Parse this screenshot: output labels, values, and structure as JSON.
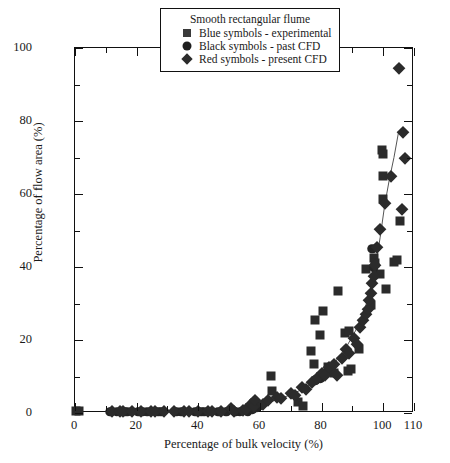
{
  "chart_data": {
    "type": "scatter",
    "title": "",
    "xlabel": "Percentage of bulk velocity (%)",
    "ylabel": "Percentage of flow area (%)",
    "xlim": [
      0,
      110
    ],
    "ylim": [
      0,
      100
    ],
    "xticks": [
      0,
      20,
      40,
      60,
      80,
      100,
      110
    ],
    "xticks_major": [
      0,
      20,
      40,
      60,
      80,
      100,
      110
    ],
    "xticks_minor": [
      10,
      30,
      50,
      70,
      90
    ],
    "yticks": [
      0,
      20,
      40,
      60,
      80,
      100
    ],
    "yticks_minor": [
      10,
      30,
      50,
      70,
      90
    ],
    "grid": false,
    "legend_position": "top-center",
    "legend": {
      "title": "Smooth rectangular flume",
      "entries": [
        {
          "symbol": "square",
          "label": "Blue symbols - experimental",
          "color": "#3a3a3a"
        },
        {
          "symbol": "circle",
          "label": "Black symbols - past CFD",
          "color": "#1e1e1e"
        },
        {
          "symbol": "diamond",
          "label": "Red symbols - present CFD",
          "color": "#2b2b2b"
        }
      ]
    },
    "series": [
      {
        "name": "Blue symbols - experimental",
        "symbol": "square",
        "color": "#2b2b2b",
        "points": [
          [
            0.4,
            0.5
          ],
          [
            1.2,
            0.5
          ],
          [
            63.5,
            10.2
          ],
          [
            64.0,
            6.0
          ],
          [
            72.5,
            3.0
          ],
          [
            74.0,
            2.0
          ],
          [
            76.5,
            17.0
          ],
          [
            77.5,
            13.5
          ],
          [
            78.0,
            25.5
          ],
          [
            79.5,
            21.5
          ],
          [
            80.5,
            28.0
          ],
          [
            82.0,
            12.5
          ],
          [
            83.0,
            11.5
          ],
          [
            84.0,
            11.0
          ],
          [
            85.5,
            33.5
          ],
          [
            87.5,
            22.0
          ],
          [
            89.0,
            22.5
          ],
          [
            88.5,
            11.5
          ],
          [
            89.5,
            12.0
          ],
          [
            92.0,
            17.5
          ],
          [
            94.5,
            39.5
          ],
          [
            96.0,
            29.5
          ],
          [
            97.0,
            42.5
          ],
          [
            97.5,
            41.0
          ],
          [
            99.0,
            38.0
          ],
          [
            99.5,
            72.0
          ],
          [
            99.8,
            71.0
          ],
          [
            99.9,
            65.0
          ],
          [
            100.0,
            58.5
          ],
          [
            101.0,
            34.0
          ],
          [
            103.5,
            41.5
          ],
          [
            104.5,
            42.0
          ],
          [
            105.5,
            52.5
          ]
        ]
      },
      {
        "name": "Black symbols - past CFD",
        "symbol": "circle",
        "color": "#242424",
        "points": [
          [
            11.5,
            0.4
          ],
          [
            13.5,
            0.4
          ],
          [
            16.0,
            0.4
          ],
          [
            17.0,
            0.4
          ],
          [
            20.5,
            0.4
          ],
          [
            22.0,
            0.4
          ],
          [
            23.5,
            0.4
          ],
          [
            27.0,
            0.4
          ],
          [
            28.0,
            0.4
          ],
          [
            33.0,
            0.4
          ],
          [
            34.5,
            0.4
          ],
          [
            39.0,
            0.4
          ],
          [
            41.0,
            0.4
          ],
          [
            42.0,
            0.4
          ],
          [
            46.5,
            0.4
          ],
          [
            49.0,
            0.4
          ],
          [
            52.0,
            0.4
          ],
          [
            53.5,
            0.4
          ],
          [
            56.0,
            0.5
          ],
          [
            57.5,
            1.0
          ],
          [
            59.0,
            1.5
          ],
          [
            60.0,
            2.0
          ],
          [
            78.0,
            9.0
          ],
          [
            79.5,
            9.5
          ],
          [
            96.5,
            45.0
          ],
          [
            97.0,
            40.0
          ]
        ]
      },
      {
        "name": "Red symbols - present CFD",
        "symbol": "diamond",
        "color": "#2b2b2b",
        "points": [
          [
            12.0,
            0.5
          ],
          [
            14.5,
            0.5
          ],
          [
            15.5,
            0.5
          ],
          [
            18.5,
            0.5
          ],
          [
            21.5,
            0.5
          ],
          [
            24.5,
            0.5
          ],
          [
            26.0,
            0.5
          ],
          [
            29.0,
            0.5
          ],
          [
            32.0,
            0.5
          ],
          [
            35.5,
            0.5
          ],
          [
            37.0,
            0.5
          ],
          [
            40.0,
            0.5
          ],
          [
            43.0,
            0.5
          ],
          [
            44.5,
            0.5
          ],
          [
            47.5,
            0.5
          ],
          [
            50.5,
            1.5
          ],
          [
            51.5,
            0.5
          ],
          [
            54.5,
            0.8
          ],
          [
            55.5,
            1.2
          ],
          [
            57.0,
            2.5
          ],
          [
            58.0,
            1.8
          ],
          [
            58.5,
            3.5
          ],
          [
            61.0,
            2.5
          ],
          [
            62.5,
            3.5
          ],
          [
            65.5,
            4.5
          ],
          [
            67.0,
            4.0
          ],
          [
            70.0,
            5.5
          ],
          [
            71.5,
            5.0
          ],
          [
            73.5,
            7.0
          ],
          [
            75.0,
            6.5
          ],
          [
            77.0,
            8.5
          ],
          [
            78.5,
            9.5
          ],
          [
            80.0,
            11.0
          ],
          [
            81.0,
            10.5
          ],
          [
            82.5,
            12.5
          ],
          [
            84.0,
            13.5
          ],
          [
            85.0,
            10.5
          ],
          [
            86.5,
            15.0
          ],
          [
            88.0,
            17.5
          ],
          [
            89.0,
            16.5
          ],
          [
            90.5,
            20.5
          ],
          [
            91.5,
            19.0
          ],
          [
            92.5,
            23.5
          ],
          [
            93.5,
            25.5
          ],
          [
            94.5,
            27.0
          ],
          [
            95.0,
            28.5
          ],
          [
            95.5,
            31.0
          ],
          [
            96.0,
            33.0
          ],
          [
            96.5,
            35.5
          ],
          [
            97.0,
            37.5
          ],
          [
            97.5,
            40.5
          ],
          [
            98.0,
            45.5
          ],
          [
            99.0,
            50.5
          ],
          [
            100.5,
            57.5
          ],
          [
            102.5,
            65.0
          ],
          [
            105.0,
            94.5
          ],
          [
            106.5,
            77.0
          ],
          [
            107.0,
            70.0
          ],
          [
            106.0,
            56.0
          ]
        ]
      }
    ],
    "trend_line": {
      "description": "fitted curve through present CFD points",
      "points": [
        [
          55.0,
          0.8
        ],
        [
          60.0,
          2.0
        ],
        [
          65.0,
          3.5
        ],
        [
          70.0,
          5.0
        ],
        [
          75.0,
          7.0
        ],
        [
          80.0,
          10.0
        ],
        [
          84.0,
          13.5
        ],
        [
          88.0,
          18.0
        ],
        [
          91.0,
          22.5
        ],
        [
          94.0,
          28.5
        ],
        [
          96.0,
          34.0
        ],
        [
          97.5,
          40.0
        ],
        [
          99.0,
          48.0
        ],
        [
          100.5,
          57.0
        ],
        [
          102.0,
          64.0
        ],
        [
          103.5,
          70.0
        ],
        [
          105.0,
          77.0
        ]
      ]
    }
  }
}
